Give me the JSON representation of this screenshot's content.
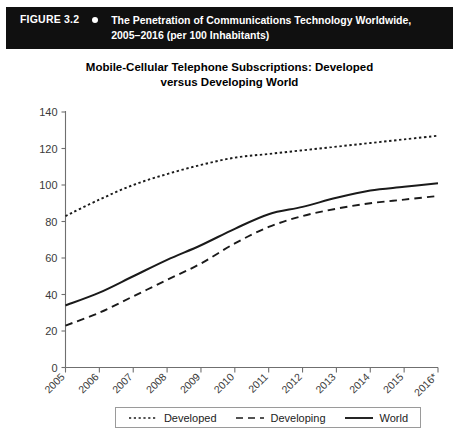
{
  "banner": {
    "figure_label": "FIGURE 3.2",
    "bullet_icon": "bullet-dot",
    "caption_line1": "The Penetration of Communications Technology Worldwide,",
    "caption_line2": "2005–2016 (per 100 Inhabitants)",
    "background_color": "#101010",
    "text_color": "#ffffff"
  },
  "chart_data": {
    "type": "line",
    "title_line1": "Mobile-Cellular Telephone Subscriptions: Developed",
    "title_line2": "versus Developing World",
    "title": "Mobile-Cellular Telephone Subscriptions: Developed versus Developing World",
    "xlabel": "",
    "ylabel": "",
    "grid": false,
    "legend_position": "bottom-center",
    "categories": [
      "2005",
      "2006",
      "2007",
      "2008",
      "2009",
      "2010",
      "2011",
      "2012",
      "2013",
      "2014",
      "2015",
      "2016*"
    ],
    "x": [
      2005,
      2006,
      2007,
      2008,
      2009,
      2010,
      2011,
      2012,
      2013,
      2014,
      2015,
      2016
    ],
    "ylim": [
      0,
      140
    ],
    "yticks": [
      0,
      20,
      40,
      60,
      80,
      100,
      120,
      140
    ],
    "ytick_labels": [
      "0",
      "20",
      "40",
      "60",
      "80",
      "100",
      "120",
      "140"
    ],
    "series": [
      {
        "name": "Developed",
        "style": "dotted",
        "color": "#1a1a1a",
        "values": [
          83,
          92,
          100,
          106,
          111,
          115,
          117,
          119,
          121,
          123,
          125,
          127
        ]
      },
      {
        "name": "Developing",
        "style": "dashed",
        "color": "#1a1a1a",
        "values": [
          23,
          30,
          39,
          48,
          57,
          68,
          77,
          83,
          87,
          90,
          92,
          94
        ]
      },
      {
        "name": "World",
        "style": "solid",
        "color": "#1a1a1a",
        "values": [
          34,
          41,
          50,
          59,
          67,
          76,
          84,
          88,
          93,
          97,
          99,
          101
        ]
      }
    ]
  },
  "legend": {
    "items": [
      {
        "label": "Developed",
        "style": "dotted"
      },
      {
        "label": "Developing",
        "style": "dashed"
      },
      {
        "label": "World",
        "style": "solid"
      }
    ]
  }
}
